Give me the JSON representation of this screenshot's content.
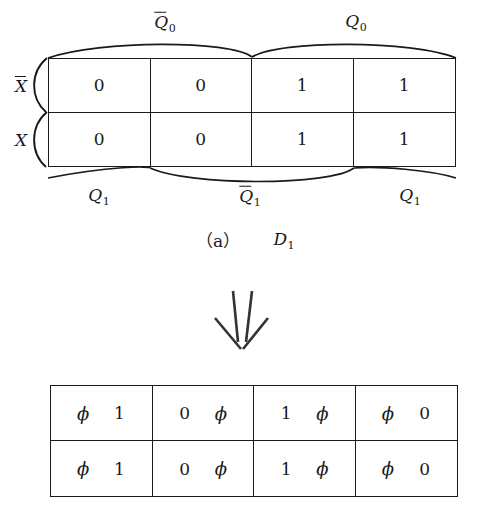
{
  "figure": {
    "caption": "（a）",
    "caption_symbol": "D",
    "caption_symbol_sub": "1"
  },
  "kmap": {
    "column_groups_top": [
      {
        "base": "Q",
        "sub": "0",
        "overline": true
      },
      {
        "base": "Q",
        "sub": "0",
        "overline": false
      }
    ],
    "column_groups_top_labels": [
      "Q0-bar",
      "Q0"
    ],
    "row_labels": [
      {
        "base": "X",
        "overline": true
      },
      {
        "base": "X",
        "overline": false
      }
    ],
    "bottom_groups": [
      {
        "base": "Q",
        "sub": "1",
        "overline": false
      },
      {
        "base": "Q",
        "sub": "1",
        "overline": true
      },
      {
        "base": "Q",
        "sub": "1",
        "overline": false
      }
    ],
    "cells": [
      [
        "0",
        "0",
        "1",
        "1"
      ],
      [
        "0",
        "0",
        "1",
        "1"
      ]
    ]
  },
  "arrow": {
    "name": "double-down-arrow",
    "glyph": "⇓"
  },
  "table": {
    "columns": 4,
    "rows": [
      [
        [
          "ϕ",
          "1"
        ],
        [
          "0",
          "ϕ"
        ],
        [
          "1",
          "ϕ"
        ],
        [
          "ϕ",
          "0"
        ]
      ],
      [
        [
          "ϕ",
          "1"
        ],
        [
          "0",
          "ϕ"
        ],
        [
          "1",
          "ϕ"
        ],
        [
          "ϕ",
          "0"
        ]
      ]
    ]
  },
  "colors": {
    "ink": "#1a1a1a",
    "background": "#ffffff"
  }
}
